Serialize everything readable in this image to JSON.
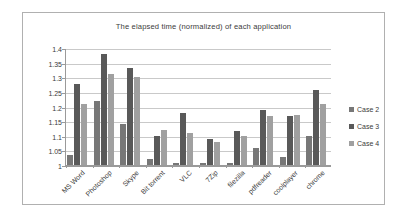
{
  "chart_data": {
    "type": "bar",
    "title": "The elapsed time (normalized) of each application",
    "xlabel": "",
    "ylabel": "",
    "ylim": [
      1,
      1.4
    ],
    "ytick_labels": [
      "1.4",
      "1.35",
      "1.3",
      "1.25",
      "1.2",
      "1.15",
      "1.1",
      "1.05",
      "1"
    ],
    "ytick_values": [
      1.4,
      1.35,
      1.3,
      1.25,
      1.2,
      1.15,
      1.1,
      1.05,
      1
    ],
    "grid": true,
    "legend_position": "right",
    "categories": [
      "MS Word",
      "Photoshop",
      "Skype",
      "Bit torrent",
      "VLC",
      "7Zip",
      "filezilla",
      "pdfreader",
      "coolplayer",
      "chrome"
    ],
    "series": [
      {
        "name": "Case 2",
        "color": "#777777",
        "values": [
          1.035,
          1.22,
          1.14,
          1.02,
          1.007,
          1.007,
          1.007,
          1.058,
          1.027,
          1.1
        ]
      },
      {
        "name": "Case 3",
        "color": "#595959",
        "values": [
          1.277,
          1.38,
          1.33,
          1.098,
          1.177,
          1.088,
          1.118,
          1.188,
          1.167,
          1.258
        ]
      },
      {
        "name": "Case 4",
        "color": "#a0a0a0",
        "values": [
          1.21,
          1.31,
          1.3,
          1.12,
          1.11,
          1.08,
          1.1,
          1.167,
          1.17,
          1.21
        ]
      }
    ]
  }
}
